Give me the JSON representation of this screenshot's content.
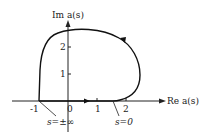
{
  "figure": {
    "type": "nyquist-plot",
    "y_axis_label": "Im a(s)",
    "x_axis_label": "Re a(s)",
    "x_ticks": [
      "-1",
      "0",
      "1",
      "2"
    ],
    "y_ticks": [
      "1",
      "2"
    ],
    "annotations": [
      {
        "text": "s=±∞",
        "points_to": "(-1, 0)"
      },
      {
        "text": "s=0",
        "points_to": "(~1.7, 0)"
      }
    ],
    "curve": {
      "description": "Closed contour starting at s=0 near (1.7,0), going counter-clockwise up the right side, peaking near Im≈2.5 at Re≈0.5, descending the left side to (-1,0) at s=±∞, then returning along the real axis to s=0",
      "direction_arrows": [
        "upper-right arc pointing up-left",
        "on real axis pointing right"
      ]
    }
  }
}
